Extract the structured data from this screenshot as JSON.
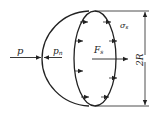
{
  "diagram": {
    "labels": {
      "pressure": "p",
      "pressure_sub": "",
      "normal_pressure": "p",
      "normal_pressure_sub": "n",
      "force": "F",
      "force_sub": "s",
      "stress": "σ",
      "stress_sub": "s",
      "diameter": "2R"
    },
    "colors": {
      "stroke": "#222222",
      "background": "#ffffff"
    }
  }
}
